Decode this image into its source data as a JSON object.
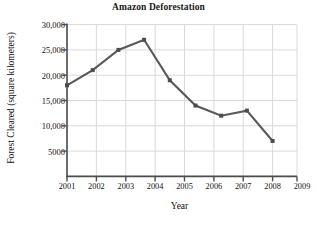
{
  "chart_data": {
    "type": "line",
    "title": "Amazon Deforestation",
    "xlabel": "Year",
    "ylabel": "Forest Cleared (square kilometers)",
    "categories": [
      "2001",
      "2002",
      "2003",
      "2004",
      "2005",
      "2006",
      "2007",
      "2008",
      "2009"
    ],
    "x": [
      2001,
      2002,
      2003,
      2004,
      2005,
      2006,
      2007,
      2008,
      2009
    ],
    "values": [
      18000,
      21000,
      25000,
      27000,
      19000,
      14000,
      12000,
      13000,
      7000
    ],
    "series": [
      {
        "name": "Forest Cleared",
        "values": [
          18000,
          21000,
          25000,
          27000,
          19000,
          14000,
          12000,
          13000,
          7000
        ]
      }
    ],
    "ylim": [
      0,
      30000
    ],
    "xlim": [
      2001,
      2009
    ],
    "yticks": [
      5000,
      10000,
      15000,
      20000,
      25000,
      30000
    ],
    "ytick_labels": [
      "5000",
      "10,000",
      "15,000",
      "20,000",
      "25,000",
      "30,000"
    ],
    "xticks": [
      2001,
      2002,
      2003,
      2004,
      2005,
      2006,
      2007,
      2008,
      2009
    ],
    "xtick_labels": [
      "2001",
      "2002",
      "2003",
      "2004",
      "2005",
      "2006",
      "2007",
      "2008",
      "2009"
    ],
    "grid": true,
    "legend": null,
    "legend_position": "none",
    "line_color": "#595959",
    "marker": "square",
    "marker_color": "#4d4d4d",
    "grid_color": "#d9d9d9",
    "axis_color": "#4d4d4d",
    "background_color": "#ffffff"
  }
}
